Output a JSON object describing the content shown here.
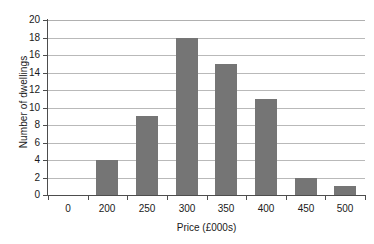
{
  "chart_data": {
    "type": "bar",
    "title": "",
    "categories": [
      "0",
      "200",
      "250",
      "300",
      "350",
      "400",
      "450",
      "500"
    ],
    "values": [
      0,
      4,
      9,
      18,
      15,
      11,
      2,
      1
    ],
    "xlabel": "Price (£000s)",
    "ylabel": "Number of dwellings",
    "ylim": [
      0,
      20
    ],
    "ytick_labels": [
      "20",
      "18",
      "16",
      "14",
      "12",
      "10",
      "8",
      "6",
      "4",
      "2",
      "0"
    ],
    "ytick_values": [
      20,
      18,
      16,
      14,
      12,
      10,
      8,
      6,
      4,
      2,
      0
    ],
    "ytick_step": 2,
    "grid": "horizontal",
    "legend": "none",
    "bar_color": "#757575",
    "grid_color": "#b9b9b9",
    "axis_color": "#4d4d4d",
    "background": "#ffffff"
  }
}
